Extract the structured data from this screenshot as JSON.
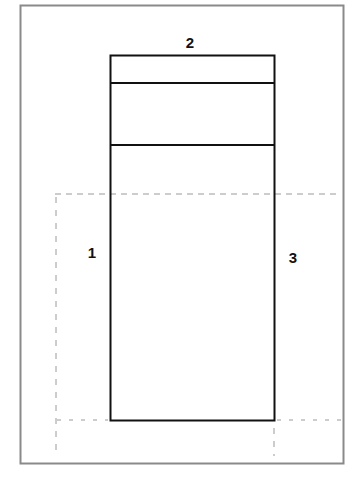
{
  "diagram": {
    "type": "layout-sketch",
    "colors": {
      "background": "#ffffff",
      "frame": "#8a8a8a",
      "solid_line": "#111111",
      "dashed_line": "#9a9a9a"
    },
    "frame": {
      "x": 20,
      "y": 5,
      "width": 323,
      "height": 458
    },
    "main_rect": {
      "x": 110,
      "y": 55,
      "width": 164,
      "height": 365
    },
    "dividers_y": [
      83,
      145
    ],
    "dashed_guides": {
      "top_horizontal": {
        "y": 194,
        "x1": 55,
        "x2": 341
      },
      "bottom_horizontal": {
        "y": 420,
        "x1": 56,
        "x2": 341
      },
      "left_vertical": {
        "x": 56,
        "y1": 196,
        "y2": 456
      },
      "right_vertical": {
        "x": 274,
        "y1": 422,
        "y2": 456
      }
    },
    "labels": [
      {
        "id": "label-1",
        "text": "1",
        "x": 92,
        "y": 252
      },
      {
        "id": "label-2",
        "text": "2",
        "x": 190,
        "y": 42
      },
      {
        "id": "label-3",
        "text": "3",
        "x": 293,
        "y": 257
      }
    ]
  }
}
